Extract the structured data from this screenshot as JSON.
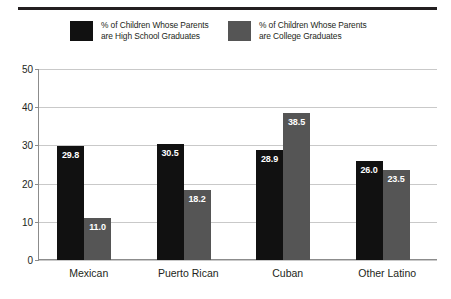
{
  "chart_data": {
    "type": "bar",
    "title": "",
    "xlabel": "",
    "ylabel": "",
    "ylim": [
      0,
      50
    ],
    "yticks": [
      "0",
      "10",
      "20",
      "30",
      "40",
      "50"
    ],
    "grid": true,
    "legend_position": "top",
    "categories": [
      "Mexican",
      "Puerto Rican",
      "Cuban",
      "Other Latino"
    ],
    "series": [
      {
        "name": "% of Children Whose Parents are High School Graduates",
        "legend_line1": "% of Children Whose Parents",
        "legend_line2": "are High School Graduates",
        "color": "#111111",
        "values": [
          29.8,
          30.5,
          28.9,
          26.0
        ],
        "labels": [
          "29.8",
          "30.5",
          "28.9",
          "26.0"
        ]
      },
      {
        "name": "% of Children Whose Parents are College Graduates",
        "legend_line1": "% of Children Whose Parents",
        "legend_line2": "are College Graduates",
        "color": "#555555",
        "values": [
          11.0,
          18.2,
          38.5,
          23.5
        ],
        "labels": [
          "11.0",
          "18.2",
          "38.5",
          "23.5"
        ]
      }
    ]
  },
  "colors": {
    "series_high_school": "#111111",
    "series_college": "#555555",
    "gridline": "#c9c9c9",
    "axis": "#8c8c8c",
    "text": "#231f20",
    "value_label": "#ffffff",
    "rule": "#231f20",
    "background": "#ffffff"
  }
}
